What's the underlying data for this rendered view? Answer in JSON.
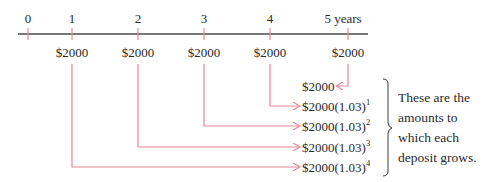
{
  "timeline": {
    "ticks": [
      {
        "label": "0",
        "x": 28
      },
      {
        "label": "1",
        "x": 72
      },
      {
        "label": "2",
        "x": 138
      },
      {
        "label": "3",
        "x": 204
      },
      {
        "label": "4",
        "x": 270
      },
      {
        "label": "5 years",
        "x": 348
      }
    ],
    "deposits": [
      {
        "period": 1,
        "amount": "$2000"
      },
      {
        "period": 2,
        "amount": "$2000"
      },
      {
        "period": 3,
        "amount": "$2000"
      },
      {
        "period": 4,
        "amount": "$2000"
      },
      {
        "period": 5,
        "amount": "$2000"
      }
    ]
  },
  "results": [
    {
      "base": "$2000",
      "factor": "",
      "exponent": ""
    },
    {
      "base": "$2000",
      "factor": "(1.03)",
      "exponent": "1"
    },
    {
      "base": "$2000",
      "factor": "(1.03)",
      "exponent": "2"
    },
    {
      "base": "$2000",
      "factor": "(1.03)",
      "exponent": "3"
    },
    {
      "base": "$2000",
      "factor": "(1.03)",
      "exponent": "4"
    }
  ],
  "explanation": {
    "lines": [
      "These are the",
      "amounts to",
      "which each",
      "deposit grows."
    ]
  },
  "colors": {
    "axis": "#4a4a4a",
    "arrow": "#e8879a",
    "text": "#2a2a2a"
  }
}
